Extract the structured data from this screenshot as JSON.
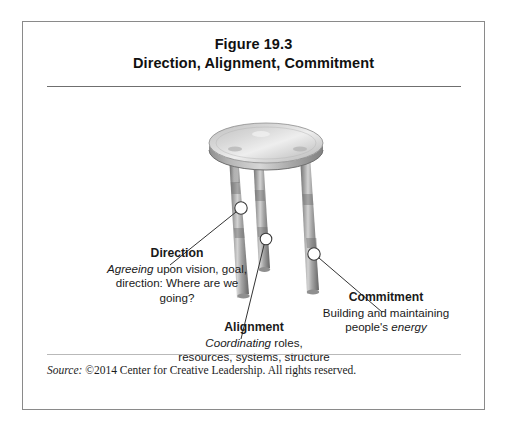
{
  "figure": {
    "title_line1": "Figure 19.3",
    "title_line2": "Direction, Alignment, Commitment",
    "source_label": "Source:",
    "source_text": " ©2014 Center for Creative Leadership. All rights reserved."
  },
  "illustration": {
    "name": "three-legged-stool-diagram",
    "description": "Three-legged stool with a round seat; each leg is tagged with a white circular marker connected by a leader line to a labeled callout.",
    "seat_color": "#c9c9c9",
    "leg_color": "#9a9a9a",
    "marker_color": "#ffffff",
    "leader_line_color": "#333333",
    "markers": [
      {
        "name": "direction-marker",
        "cx": 218,
        "cy": 186
      },
      {
        "name": "alignment-marker",
        "cx": 243,
        "cy": 217
      },
      {
        "name": "commitment-marker",
        "cx": 291,
        "cy": 232
      }
    ],
    "leaders": [
      {
        "name": "direction-leader",
        "x1": 213,
        "y1": 190,
        "x2": 147,
        "y2": 243
      },
      {
        "name": "alignment-leader",
        "x1": 241,
        "y1": 223,
        "x2": 218,
        "y2": 317
      },
      {
        "name": "commitment-leader",
        "x1": 296,
        "y1": 236,
        "x2": 359,
        "y2": 290
      }
    ]
  },
  "callouts": [
    {
      "id": "direction",
      "title": "Direction",
      "body_italic_lead": "Agreeing",
      "body_rest": " upon vision, goal, direction: Where are we going?"
    },
    {
      "id": "alignment",
      "title": "Alignment",
      "body_italic_lead": "Coordinating",
      "body_rest": " roles, resources, systems, structure"
    },
    {
      "id": "commitment",
      "title": "Commitment",
      "body_lead": "Building and maintaining people's ",
      "body_italic_tail": "energy"
    }
  ]
}
